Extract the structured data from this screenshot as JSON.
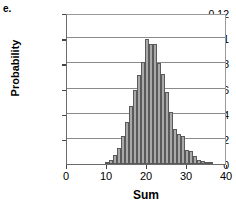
{
  "panel": {
    "letter": "e."
  },
  "chart_data": {
    "type": "bar",
    "title": "",
    "xlabel": "Sum",
    "ylabel": "Probability",
    "xlim": [
      0,
      40
    ],
    "ylim": [
      0,
      0.12
    ],
    "grid": true,
    "legend": false,
    "xticks": [
      0,
      10,
      20,
      30,
      40
    ],
    "xtick_labels": [
      "0",
      "10",
      "20",
      "30",
      "40"
    ],
    "yticks": [
      0,
      0.02,
      0.04,
      0.06,
      0.08,
      0.1,
      0.12
    ],
    "ytick_labels": [
      "0",
      "0.02",
      "0.04",
      "0.06",
      "0.08",
      "0.1",
      "0.12"
    ],
    "bar_color": "#a9a9a9",
    "bar_edge_color": "#5a5a5a",
    "grid_color": "#8a8a8a",
    "categories": [
      10,
      11,
      12,
      13,
      14,
      15,
      16,
      17,
      18,
      19,
      20,
      21,
      22,
      23,
      24,
      25,
      26,
      27,
      28,
      29,
      30,
      31,
      32,
      33,
      34,
      35,
      36
    ],
    "values": [
      0.001,
      0.003,
      0.007,
      0.013,
      0.022,
      0.033,
      0.046,
      0.059,
      0.071,
      0.081,
      0.0995,
      0.0955,
      0.095,
      0.0805,
      0.0715,
      0.0575,
      0.041,
      0.028,
      0.0235,
      0.022,
      0.0115,
      0.0105,
      0.006,
      0.0035,
      0.002,
      0.0012,
      0.0006
    ]
  }
}
